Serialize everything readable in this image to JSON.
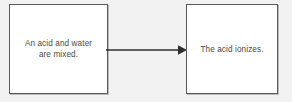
{
  "diagram": {
    "type": "flowchart",
    "orientation": "left-to-right",
    "background_color": "#f2f2f2",
    "box_fill_color": "#ffffff",
    "box_border_color": "#5a5a5a",
    "text_color": "#4a4a4a",
    "arrow_color": "#2e2e2e",
    "nodes": [
      {
        "id": "node-1",
        "label": "An acid and water\nare mixed.",
        "name": "acid-water-mixed-box"
      },
      {
        "id": "node-2",
        "label": "The acid ionizes.",
        "name": "acid-ionizes-box"
      }
    ],
    "edges": [
      {
        "id": "edge-1",
        "from": "node-1",
        "to": "node-2",
        "label": "",
        "arrowhead": "solid-triangle",
        "direction": "right"
      }
    ]
  }
}
